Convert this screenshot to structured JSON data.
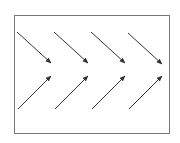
{
  "diagram": {
    "frame": {
      "x": 14,
      "y": 15,
      "width": 155,
      "height": 118,
      "stroke": "#777777"
    },
    "arrow_color": "#333333",
    "arrows": [
      {
        "row": "top",
        "x1": 17,
        "y1": 32,
        "x2": 51,
        "y2": 63
      },
      {
        "row": "top",
        "x1": 54,
        "y1": 32,
        "x2": 88,
        "y2": 63
      },
      {
        "row": "top",
        "x1": 91,
        "y1": 32,
        "x2": 125,
        "y2": 63
      },
      {
        "row": "top",
        "x1": 128,
        "y1": 33,
        "x2": 162,
        "y2": 64
      },
      {
        "row": "bottom",
        "x1": 18,
        "y1": 109,
        "x2": 51,
        "y2": 76
      },
      {
        "row": "bottom",
        "x1": 55,
        "y1": 109,
        "x2": 88,
        "y2": 76
      },
      {
        "row": "bottom",
        "x1": 92,
        "y1": 109,
        "x2": 125,
        "y2": 76
      },
      {
        "row": "bottom",
        "x1": 129,
        "y1": 109,
        "x2": 162,
        "y2": 76
      }
    ]
  }
}
